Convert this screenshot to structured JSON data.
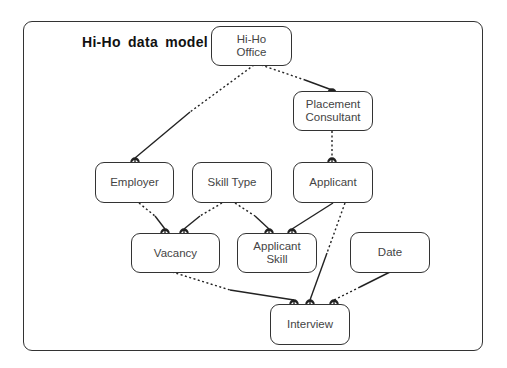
{
  "diagram": {
    "title": "Hi-Ho  data  model",
    "type": "entity-relationship",
    "entities": [
      {
        "id": "hiho_office",
        "label": "Hi-Ho\nOffice"
      },
      {
        "id": "placement_consultant",
        "label": "Placement\nConsultant"
      },
      {
        "id": "employer",
        "label": "Employer"
      },
      {
        "id": "skill_type",
        "label": "Skill Type"
      },
      {
        "id": "applicant",
        "label": "Applicant"
      },
      {
        "id": "vacancy",
        "label": "Vacancy"
      },
      {
        "id": "applicant_skill",
        "label": "Applicant\nSkill"
      },
      {
        "id": "date",
        "label": "Date"
      },
      {
        "id": "interview",
        "label": "Interview"
      }
    ],
    "relationships": [
      {
        "from": "hiho_office",
        "to": "placement_consultant",
        "to_cardinality": "many"
      },
      {
        "from": "hiho_office",
        "to": "employer",
        "to_cardinality": "many"
      },
      {
        "from": "placement_consultant",
        "to": "applicant",
        "to_cardinality": "many"
      },
      {
        "from": "employer",
        "to": "vacancy",
        "to_cardinality": "many"
      },
      {
        "from": "skill_type",
        "to": "vacancy",
        "to_cardinality": "many"
      },
      {
        "from": "skill_type",
        "to": "applicant_skill",
        "to_cardinality": "many"
      },
      {
        "from": "applicant",
        "to": "applicant_skill",
        "to_cardinality": "many"
      },
      {
        "from": "vacancy",
        "to": "interview",
        "to_cardinality": "many"
      },
      {
        "from": "applicant",
        "to": "interview",
        "to_cardinality": "many"
      },
      {
        "from": "date",
        "to": "interview",
        "to_cardinality": "many"
      }
    ]
  }
}
